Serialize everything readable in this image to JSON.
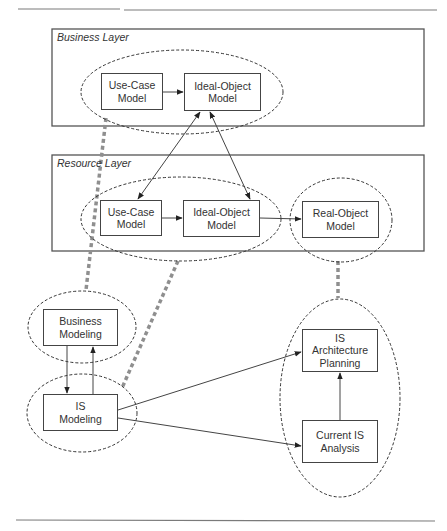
{
  "layers": {
    "business": {
      "label": "Business Layer"
    },
    "resource": {
      "label": "Resource Layer"
    }
  },
  "nodes": {
    "business_use_case": "Use-Case\nModel",
    "business_ideal_object": "Ideal-Object\nModel",
    "resource_use_case": "Use-Case\nModel",
    "resource_ideal_object": "Ideal-Object\nModel",
    "resource_real_object": "Real-Object\nModel",
    "business_modeling": "Business\nModeling",
    "is_modeling": "IS\nModeling",
    "is_architecture_planning": "IS\nArchitecture\nPlanning",
    "current_is_analysis": "Current IS\nAnalysis"
  },
  "edges": [
    {
      "from": "business_use_case",
      "to": "business_ideal_object",
      "type": "arrow"
    },
    {
      "from": "business_ideal_object",
      "to": "resource_use_case",
      "type": "bidirectional"
    },
    {
      "from": "business_ideal_object",
      "to": "resource_ideal_object",
      "type": "bidirectional"
    },
    {
      "from": "resource_use_case",
      "to": "resource_ideal_object",
      "type": "arrow"
    },
    {
      "from": "resource_ideal_object",
      "to": "resource_real_object",
      "type": "arrow"
    },
    {
      "from": "business_modeling",
      "to": "is_modeling",
      "type": "arrow"
    },
    {
      "from": "is_modeling",
      "to": "business_modeling",
      "type": "arrow"
    },
    {
      "from": "is_modeling",
      "to": "is_architecture_planning",
      "type": "arrow"
    },
    {
      "from": "is_modeling",
      "to": "current_is_analysis",
      "type": "arrow"
    },
    {
      "from": "current_is_analysis",
      "to": "is_architecture_planning",
      "type": "arrow"
    },
    {
      "from": "business_modeling_group",
      "to": "business_layer_group",
      "type": "mapping"
    },
    {
      "from": "is_modeling_group",
      "to": "resource_layer_group",
      "type": "mapping"
    },
    {
      "from": "is_planning_group",
      "to": "real_object_group",
      "type": "mapping"
    }
  ],
  "colors": {
    "line": "#444444",
    "dashed_ellipse": "#333333",
    "mapping": "#8f8f8f",
    "rule": "#7a7a7a"
  }
}
